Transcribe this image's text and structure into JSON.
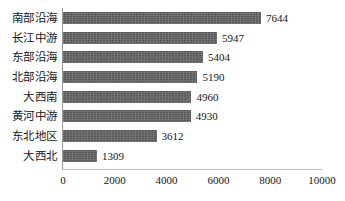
{
  "chart_data": {
    "type": "bar",
    "orientation": "horizontal",
    "title": "",
    "subtitle": "",
    "xlabel": "",
    "ylabel": "",
    "xlim": [
      0,
      10000
    ],
    "xticks": [
      "0",
      "2000",
      "4000",
      "6000",
      "8000",
      "10000"
    ],
    "grid": false,
    "legend": null,
    "bar_color": "#5f5f5f",
    "categories": [
      "南部沿海",
      "长江中游",
      "东部沿海",
      "北部沿海",
      "大西南",
      "黄河中游",
      "东北地区",
      "大西北"
    ],
    "values": [
      7644,
      5947,
      5404,
      5190,
      4960,
      4930,
      3612,
      1309
    ],
    "data_labels": [
      "7644",
      "5947",
      "5404",
      "5190",
      "4960",
      "4930",
      "3612",
      "1309"
    ],
    "rows": [
      {
        "category": "南部沿海",
        "value": 7644,
        "label": "7644"
      },
      {
        "category": "长江中游",
        "value": 5947,
        "label": "5947"
      },
      {
        "category": "东部沿海",
        "value": 5404,
        "label": "5404"
      },
      {
        "category": "北部沿海",
        "value": 5190,
        "label": "5190"
      },
      {
        "category": "大西南",
        "value": 4960,
        "label": "4960"
      },
      {
        "category": "黄河中游",
        "value": 4930,
        "label": "4930"
      },
      {
        "category": "东北地区",
        "value": 3612,
        "label": "3612"
      },
      {
        "category": "大西北",
        "value": 1309,
        "label": "1309"
      }
    ]
  }
}
